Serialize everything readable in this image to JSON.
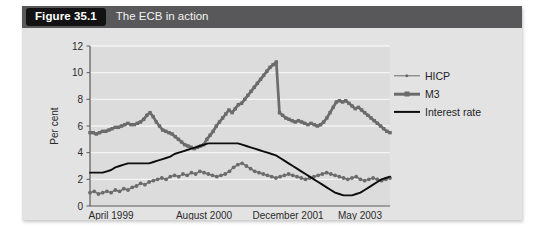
{
  "figure": {
    "number_label": "Figure 35.1",
    "title": "The ECB in action"
  },
  "chart_data": {
    "type": "line",
    "title": "The ECB in action",
    "xlabel": "",
    "ylabel": "Per cent",
    "ylim": [
      0,
      12
    ],
    "yticks": [
      0,
      2,
      4,
      6,
      8,
      10,
      12
    ],
    "grid": true,
    "legend_position": "right",
    "xtick_labels": [
      "April 1999",
      "August 2000",
      "December 2001",
      "May 2003"
    ],
    "xtick_positions": [
      0.07,
      0.38,
      0.66,
      0.9
    ],
    "x_note": "Monthly observations, April 1999 through mid 2003",
    "series": [
      {
        "name": "HICP",
        "color": "#6b6b6b",
        "marker": "dot",
        "values": [
          1.0,
          1.1,
          0.9,
          1.0,
          1.1,
          1.0,
          1.2,
          1.1,
          1.3,
          1.2,
          1.4,
          1.5,
          1.7,
          1.6,
          1.8,
          1.9,
          2.0,
          2.1,
          2.0,
          2.2,
          2.3,
          2.2,
          2.4,
          2.3,
          2.5,
          2.4,
          2.6,
          2.5,
          2.4,
          2.3,
          2.2,
          2.3,
          2.4,
          2.6,
          2.9,
          3.1,
          3.2,
          3.0,
          2.8,
          2.6,
          2.5,
          2.4,
          2.3,
          2.2,
          2.1,
          2.2,
          2.3,
          2.4,
          2.3,
          2.2,
          2.1,
          2.0,
          2.1,
          2.2,
          2.3,
          2.4,
          2.5,
          2.4,
          2.3,
          2.2,
          2.1,
          2.0,
          2.1,
          2.2,
          2.0,
          1.9,
          2.0,
          2.1,
          2.0,
          1.9,
          2.0,
          2.1
        ]
      },
      {
        "name": "M3",
        "color": "#6b6b6b",
        "marker": "square",
        "values": [
          5.5,
          5.5,
          5.4,
          5.5,
          5.6,
          5.6,
          5.7,
          5.8,
          5.9,
          5.9,
          6.0,
          6.1,
          6.2,
          6.1,
          6.1,
          6.2,
          6.3,
          6.5,
          6.8,
          7.0,
          6.7,
          6.3,
          6.0,
          5.7,
          5.6,
          5.5,
          5.4,
          5.2,
          5.0,
          4.8,
          4.6,
          4.5,
          4.4,
          4.3,
          4.4,
          4.5,
          4.6,
          5.0,
          5.3,
          5.6,
          6.0,
          6.3,
          6.6,
          6.9,
          7.2,
          7.0,
          7.3,
          7.6,
          7.7,
          8.0,
          8.3,
          8.6,
          8.9,
          9.2,
          9.5,
          9.8,
          10.1,
          10.4,
          10.6,
          10.8,
          7.0,
          6.8,
          6.6,
          6.5,
          6.4,
          6.3,
          6.4,
          6.3,
          6.2,
          6.1,
          6.2,
          6.1,
          6.0,
          6.1,
          6.3,
          6.6,
          7.0,
          7.4,
          7.8,
          7.9,
          7.8,
          7.9,
          7.7,
          7.5,
          7.3,
          7.4,
          7.2,
          7.0,
          6.8,
          6.6,
          6.4,
          6.2,
          6.0,
          5.8,
          5.6,
          5.5
        ]
      },
      {
        "name": "Interest rate",
        "color": "#0d0d0d",
        "marker": "none",
        "values": [
          2.5,
          2.5,
          2.5,
          2.5,
          2.6,
          2.7,
          2.9,
          3.0,
          3.1,
          3.2,
          3.2,
          3.2,
          3.2,
          3.2,
          3.2,
          3.3,
          3.4,
          3.5,
          3.6,
          3.7,
          3.9,
          4.0,
          4.1,
          4.2,
          4.3,
          4.4,
          4.5,
          4.6,
          4.7,
          4.7,
          4.7,
          4.7,
          4.7,
          4.7,
          4.7,
          4.7,
          4.6,
          4.5,
          4.4,
          4.3,
          4.2,
          4.1,
          4.0,
          3.9,
          3.8,
          3.6,
          3.4,
          3.2,
          3.0,
          2.8,
          2.6,
          2.4,
          2.2,
          2.0,
          1.8,
          1.6,
          1.4,
          1.2,
          1.0,
          0.9,
          0.8,
          0.8,
          0.8,
          0.9,
          1.0,
          1.2,
          1.4,
          1.6,
          1.8,
          2.0,
          2.1,
          2.2
        ]
      }
    ]
  },
  "legend": {
    "items": [
      {
        "label": "HICP",
        "style": "thin-dot"
      },
      {
        "label": "M3",
        "style": "thick-square"
      },
      {
        "label": "Interest rate",
        "style": "solid"
      }
    ]
  }
}
